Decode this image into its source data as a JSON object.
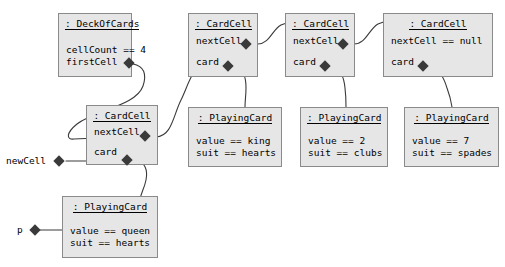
{
  "diagram": {
    "kind": "uml-object-diagram",
    "title": "",
    "colors": {
      "box_fill": "#e6e6e6",
      "box_border": "#8a8a8a",
      "text": "#000000",
      "edge": "#3a3a3a",
      "diamond": "#3a3a3a",
      "background": "#ffffff"
    },
    "objects": [
      {
        "id": "deck",
        "title": ": DeckOfCards",
        "attrs": [
          "cellCount == 4",
          "firstCell"
        ],
        "slots": [
          "firstCell"
        ]
      },
      {
        "id": "cell1",
        "title": ": CardCell",
        "attrs": [
          "nextCell",
          "card"
        ],
        "slots": [
          "nextCell",
          "card"
        ]
      },
      {
        "id": "cell2",
        "title": ": CardCell",
        "attrs": [
          "nextCell",
          "card"
        ],
        "slots": [
          "nextCell",
          "card"
        ]
      },
      {
        "id": "cell3",
        "title": ": CardCell",
        "attrs": [
          "nextCell == null",
          "card"
        ],
        "slots": [
          "card"
        ]
      },
      {
        "id": "cell0",
        "title": ": CardCell",
        "attrs": [
          "nextCell",
          "card"
        ],
        "slots": [
          "nextCell",
          "card"
        ]
      },
      {
        "id": "card1",
        "title": ": PlayingCard",
        "attrs": [
          "value == king",
          "suit == hearts"
        ],
        "slots": []
      },
      {
        "id": "card2",
        "title": ": PlayingCard",
        "attrs": [
          "value == 2",
          "suit == clubs"
        ],
        "slots": []
      },
      {
        "id": "card3",
        "title": ": PlayingCard",
        "attrs": [
          "value == 7",
          "suit == spades"
        ],
        "slots": []
      },
      {
        "id": "card0",
        "title": ": PlayingCard",
        "attrs": [
          "value == queen",
          "suit == hearts"
        ],
        "slots": []
      }
    ],
    "role_labels": [
      {
        "id": "newCell",
        "text": "newCell"
      },
      {
        "id": "p",
        "text": "p"
      }
    ]
  }
}
